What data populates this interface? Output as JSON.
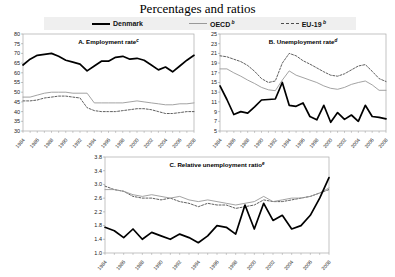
{
  "title": "Percentages and ratios",
  "legend": {
    "items": [
      {
        "label": "Denmark",
        "sup": "",
        "color": "#000000",
        "style": "solid",
        "thick": true
      },
      {
        "label": "OECD",
        "sup": "b",
        "color": "#999999",
        "style": "solid",
        "thick": false
      },
      {
        "label": "EU-19",
        "sup": "b",
        "color": "#4d4d4d",
        "style": "dashed",
        "thick": false
      }
    ]
  },
  "colors": {
    "plot_border": "#aaaaaa",
    "legend_bg": "#efefef",
    "tick": "#888888",
    "label_text": "#222222"
  },
  "chart_data": [
    {
      "type": "line",
      "panel_label": "A. Employment rate",
      "panel_label_sup": "c",
      "x": [
        1984,
        1985,
        1986,
        1987,
        1988,
        1989,
        1990,
        1991,
        1992,
        1993,
        1994,
        1995,
        1996,
        1997,
        1998,
        1999,
        2000,
        2001,
        2002,
        2003,
        2004,
        2005,
        2006,
        2007,
        2008
      ],
      "xtick_labels": [
        "1984",
        "1986",
        "1988",
        "1990",
        "1992",
        "1994",
        "1996",
        "1998",
        "2000",
        "2002",
        "2004",
        "2006",
        "2008"
      ],
      "ylim": [
        30,
        80
      ],
      "yticks": [
        "30",
        "35",
        "40",
        "45",
        "50",
        "55",
        "60",
        "65",
        "70",
        "75",
        "80"
      ],
      "series": [
        {
          "name": "Denmark",
          "values": [
            64,
            67,
            69,
            69.5,
            70,
            68.5,
            66.5,
            65.5,
            64.5,
            61,
            63.5,
            66,
            66,
            68,
            68.5,
            67,
            67.5,
            66.5,
            64,
            61.5,
            63,
            60.5,
            63.5,
            66.5,
            69
          ]
        },
        {
          "name": "OECD",
          "values": [
            47.5,
            47.5,
            48.5,
            49.5,
            50,
            50,
            50,
            49.5,
            49.5,
            49.5,
            44.5,
            44.5,
            44.5,
            44.5,
            44.5,
            45,
            45.5,
            45,
            44.5,
            44,
            43.5,
            43.5,
            44,
            44,
            44.5
          ]
        },
        {
          "name": "EU-19",
          "values": [
            45.5,
            45.5,
            46,
            47,
            47.5,
            48,
            48,
            47.5,
            47,
            42,
            40.5,
            40,
            40,
            40,
            40.5,
            41,
            41.5,
            41.5,
            41,
            40,
            39,
            39,
            39.5,
            40,
            40
          ]
        }
      ]
    },
    {
      "type": "line",
      "panel_label": "B. Unemployment rate",
      "panel_label_sup": "d",
      "x": [
        1984,
        1985,
        1986,
        1987,
        1988,
        1989,
        1990,
        1991,
        1992,
        1993,
        1994,
        1995,
        1996,
        1997,
        1998,
        1999,
        2000,
        2001,
        2002,
        2003,
        2004,
        2005,
        2006,
        2007,
        2008
      ],
      "xtick_labels": [
        "1984",
        "1986",
        "1988",
        "1990",
        "1992",
        "1994",
        "1996",
        "1998",
        "2000",
        "2002",
        "2004",
        "2006",
        "2008"
      ],
      "ylim": [
        5,
        25
      ],
      "yticks": [
        "5",
        "7",
        "9",
        "11",
        "13",
        "15",
        "17",
        "19",
        "21",
        "23",
        "25"
      ],
      "series": [
        {
          "name": "Denmark",
          "values": [
            14.3,
            11.5,
            8.4,
            9.0,
            8.7,
            10.0,
            11.4,
            11.5,
            11.6,
            15.0,
            10.3,
            10.1,
            10.8,
            8.0,
            7.3,
            10.3,
            6.8,
            8.8,
            7.4,
            8.3,
            7.0,
            10.3,
            8.0,
            7.8,
            7.5
          ]
        },
        {
          "name": "OECD",
          "values": [
            17.8,
            17.8,
            17.0,
            16.3,
            15.5,
            14.8,
            14.0,
            13.5,
            13.3,
            15.5,
            17.4,
            16.5,
            16.0,
            15.5,
            15.0,
            14.3,
            13.8,
            13.6,
            14.0,
            14.6,
            15.0,
            15.3,
            14.5,
            13.4,
            13.4
          ]
        },
        {
          "name": "EU-19",
          "values": [
            20.5,
            20.3,
            19.8,
            19.3,
            18.5,
            17.3,
            15.8,
            15.0,
            15.3,
            19.0,
            21.0,
            20.5,
            19.5,
            18.8,
            18.0,
            17.2,
            16.5,
            16.3,
            16.8,
            17.6,
            18.4,
            18.7,
            17.3,
            15.8,
            15.2
          ]
        }
      ]
    },
    {
      "type": "line",
      "panel_label": "C. Relative unemployment ratio",
      "panel_label_sup": "e",
      "x": [
        1984,
        1985,
        1986,
        1987,
        1988,
        1989,
        1990,
        1991,
        1992,
        1993,
        1994,
        1995,
        1996,
        1997,
        1998,
        1999,
        2000,
        2001,
        2002,
        2003,
        2004,
        2005,
        2006,
        2007,
        2008
      ],
      "xtick_labels": [
        "1984",
        "1986",
        "1988",
        "1990",
        "1992",
        "1994",
        "1996",
        "1998",
        "2000",
        "2002",
        "2004",
        "2006",
        "2008"
      ],
      "ylim": [
        1.0,
        3.8
      ],
      "yticks": [
        "1.0",
        "1.4",
        "1.8",
        "2.2",
        "2.6",
        "3.0",
        "3.4",
        "3.8"
      ],
      "series": [
        {
          "name": "Denmark",
          "values": [
            1.75,
            1.65,
            1.45,
            1.7,
            1.4,
            1.6,
            1.5,
            1.4,
            1.55,
            1.45,
            1.3,
            1.5,
            1.8,
            1.75,
            1.55,
            2.4,
            1.7,
            2.45,
            1.95,
            2.1,
            1.7,
            1.8,
            2.1,
            2.6,
            3.2
          ]
        },
        {
          "name": "OECD",
          "values": [
            2.85,
            2.85,
            2.8,
            2.7,
            2.65,
            2.7,
            2.65,
            2.6,
            2.65,
            2.55,
            2.5,
            2.55,
            2.5,
            2.45,
            2.4,
            2.45,
            2.5,
            2.65,
            2.5,
            2.55,
            2.6,
            2.6,
            2.65,
            2.75,
            2.9
          ]
        },
        {
          "name": "EU-19",
          "values": [
            2.95,
            2.85,
            2.8,
            2.65,
            2.6,
            2.6,
            2.55,
            2.6,
            2.5,
            2.45,
            2.35,
            2.45,
            2.4,
            2.4,
            2.3,
            2.35,
            2.4,
            2.55,
            2.5,
            2.5,
            2.55,
            2.6,
            2.65,
            2.75,
            2.85
          ]
        }
      ]
    }
  ]
}
